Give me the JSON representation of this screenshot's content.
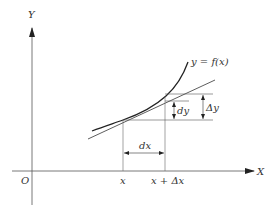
{
  "diagram": {
    "axes": {
      "x_label": "X",
      "y_label": "Y",
      "origin_label": "O"
    },
    "curve_label": "y = f(x)",
    "tick_labels": {
      "x": "x",
      "x_plus_dx": "x + Δx"
    },
    "annotations": {
      "dx": "dx",
      "dy": "dy",
      "delta_y": "Δy"
    },
    "colors": {
      "stroke": "#222222",
      "thin": "#555555",
      "background": "#ffffff"
    }
  }
}
